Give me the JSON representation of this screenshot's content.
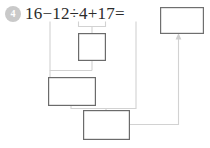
{
  "problem": {
    "number_label": "4",
    "expression": "16−12÷4+17=",
    "operands": [
      "16",
      "12",
      "4",
      "17"
    ],
    "operators": [
      "−",
      "÷",
      "+"
    ],
    "equals_sign": "=",
    "answer_value": "",
    "answer_placeholder": ""
  },
  "work_boxes": [
    {
      "id": "box-step-1",
      "value": "",
      "label_hint": "12÷4"
    },
    {
      "id": "box-step-2",
      "value": "",
      "label_hint": "16−(12÷4)"
    },
    {
      "id": "box-step-3",
      "value": "",
      "label_hint": "(16−(12÷4))+17"
    }
  ],
  "colors": {
    "background": "#ffffff",
    "text": "#2b2b2b",
    "badge_fill": "#c9c9c9",
    "badge_text": "#ffffff",
    "box_stroke": "#6b6b6b",
    "connector": "#d2d2d2",
    "arrow": "#cfcfcf"
  },
  "geometry": {
    "answer_box": {
      "x": 160,
      "y": 7,
      "w": 43,
      "h": 26
    },
    "box_1": {
      "x": 78,
      "y": 33,
      "w": 27,
      "h": 27
    },
    "box_2": {
      "x": 48,
      "y": 77,
      "w": 47,
      "h": 28
    },
    "box_3": {
      "x": 83,
      "y": 110,
      "w": 46,
      "h": 29
    }
  },
  "icons": {
    "arrow_up": "arrow-up-icon"
  }
}
